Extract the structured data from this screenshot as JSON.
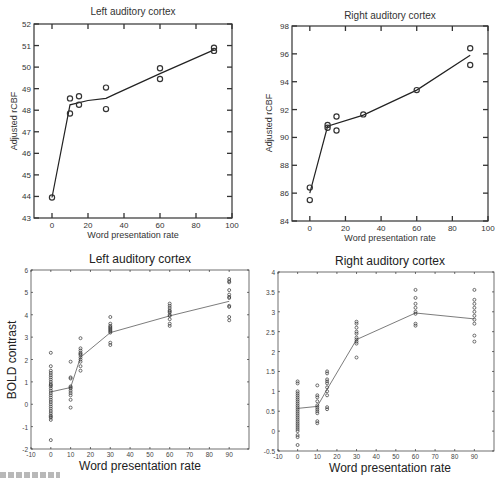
{
  "figure": {
    "panels": [
      "top-left",
      "top-right",
      "bottom-left",
      "bottom-right"
    ]
  },
  "chart_data": [
    {
      "id": "tl",
      "type": "scatter",
      "title": "Left auditory cortex",
      "xlabel": "Word presentation rate",
      "ylabel": "Adjusted rCBF",
      "xlim": [
        -10,
        100
      ],
      "ylim": [
        43,
        52
      ],
      "xticks": [
        0,
        20,
        40,
        60,
        80,
        100
      ],
      "yticks": [
        43,
        44,
        45,
        46,
        47,
        48,
        49,
        50,
        51,
        52
      ],
      "grid": false,
      "legend": null,
      "points": [
        [
          0,
          43.95
        ],
        [
          10,
          48.55
        ],
        [
          10,
          47.85
        ],
        [
          15,
          48.65
        ],
        [
          15,
          48.25
        ],
        [
          30,
          49.05
        ],
        [
          30,
          48.05
        ],
        [
          60,
          49.95
        ],
        [
          60,
          49.45
        ],
        [
          90,
          50.9
        ],
        [
          90,
          50.75
        ]
      ],
      "fit_line": [
        [
          0,
          43.95
        ],
        [
          10,
          48.25
        ],
        [
          20,
          48.45
        ],
        [
          30,
          48.55
        ],
        [
          35,
          48.75
        ],
        [
          60,
          49.7
        ],
        [
          90,
          50.8
        ]
      ]
    },
    {
      "id": "tr",
      "type": "scatter",
      "title": "Right auditory cortex",
      "xlabel": "Word presentation rate",
      "ylabel": "Adjusted rCBF",
      "xlim": [
        -10,
        100
      ],
      "ylim": [
        84,
        98
      ],
      "xticks": [
        0,
        20,
        40,
        60,
        80,
        100
      ],
      "yticks": [
        84,
        86,
        88,
        90,
        92,
        94,
        96,
        98
      ],
      "grid": false,
      "legend": null,
      "points": [
        [
          0,
          86.4
        ],
        [
          0,
          85.5
        ],
        [
          10,
          90.9
        ],
        [
          10,
          90.7
        ],
        [
          15,
          91.5
        ],
        [
          15,
          90.5
        ],
        [
          30,
          91.65
        ],
        [
          60,
          93.4
        ],
        [
          90,
          96.4
        ],
        [
          90,
          95.2
        ]
      ],
      "fit_line": [
        [
          0,
          86.0
        ],
        [
          10,
          90.8
        ],
        [
          30,
          91.6
        ],
        [
          60,
          93.4
        ],
        [
          90,
          95.9
        ]
      ]
    },
    {
      "id": "bl",
      "type": "scatter",
      "title": "Left auditory cortex",
      "xlabel": "Word presentation rate",
      "ylabel": "BOLD contrast",
      "xlim": [
        -10,
        100
      ],
      "ylim": [
        -2,
        6
      ],
      "xticks": [
        -10,
        0,
        10,
        20,
        30,
        40,
        50,
        60,
        70,
        80,
        90
      ],
      "yticks": [
        -2,
        -1,
        0,
        1,
        2,
        3,
        4,
        5,
        6
      ],
      "grid": false,
      "legend": null,
      "points": [
        [
          0,
          2.3
        ],
        [
          0,
          1.7
        ],
        [
          0,
          1.5
        ],
        [
          0,
          1.4
        ],
        [
          0,
          1.3
        ],
        [
          0,
          1.2
        ],
        [
          0,
          1.1
        ],
        [
          0,
          1.0
        ],
        [
          0,
          0.9
        ],
        [
          0,
          0.85
        ],
        [
          0,
          0.8
        ],
        [
          0,
          0.7
        ],
        [
          0,
          0.6
        ],
        [
          0,
          0.5
        ],
        [
          0,
          0.4
        ],
        [
          0,
          0.3
        ],
        [
          0,
          0.2
        ],
        [
          0,
          0.1
        ],
        [
          0,
          0.0
        ],
        [
          0,
          -0.1
        ],
        [
          0,
          -0.2
        ],
        [
          0,
          -0.3
        ],
        [
          0,
          -0.4
        ],
        [
          0,
          -0.5
        ],
        [
          0,
          -0.55
        ],
        [
          0,
          -0.6
        ],
        [
          0,
          -0.7
        ],
        [
          0,
          -1.6
        ],
        [
          10,
          1.9
        ],
        [
          10,
          1.2
        ],
        [
          10,
          1.15
        ],
        [
          10,
          0.8
        ],
        [
          10,
          0.75
        ],
        [
          10,
          0.7
        ],
        [
          10,
          0.6
        ],
        [
          10,
          0.5
        ],
        [
          10,
          0.4
        ],
        [
          10,
          0.2
        ],
        [
          10,
          -0.15
        ],
        [
          15,
          2.95
        ],
        [
          15,
          2.5
        ],
        [
          15,
          2.4
        ],
        [
          15,
          2.3
        ],
        [
          15,
          2.25
        ],
        [
          15,
          2.2
        ],
        [
          15,
          2.1
        ],
        [
          15,
          2.0
        ],
        [
          15,
          1.9
        ],
        [
          15,
          1.7
        ],
        [
          15,
          1.5
        ],
        [
          30,
          3.9
        ],
        [
          30,
          3.6
        ],
        [
          30,
          3.5
        ],
        [
          30,
          3.45
        ],
        [
          30,
          3.4
        ],
        [
          30,
          3.35
        ],
        [
          30,
          3.3
        ],
        [
          30,
          3.25
        ],
        [
          30,
          3.2
        ],
        [
          30,
          2.75
        ],
        [
          30,
          2.65
        ],
        [
          60,
          4.5
        ],
        [
          60,
          4.4
        ],
        [
          60,
          4.3
        ],
        [
          60,
          4.2
        ],
        [
          60,
          4.15
        ],
        [
          60,
          4.1
        ],
        [
          60,
          4.0
        ],
        [
          60,
          3.95
        ],
        [
          60,
          3.8
        ],
        [
          60,
          3.6
        ],
        [
          60,
          3.5
        ],
        [
          90,
          5.6
        ],
        [
          90,
          5.5
        ],
        [
          90,
          5.45
        ],
        [
          90,
          5.1
        ],
        [
          90,
          4.9
        ],
        [
          90,
          4.8
        ],
        [
          90,
          4.75
        ],
        [
          90,
          4.4
        ],
        [
          90,
          4.35
        ],
        [
          90,
          3.9
        ],
        [
          90,
          3.75
        ]
      ],
      "fit_line": [
        [
          0,
          0.55
        ],
        [
          10,
          0.75
        ],
        [
          15,
          2.1
        ],
        [
          30,
          3.2
        ],
        [
          60,
          3.95
        ],
        [
          90,
          4.6
        ]
      ]
    },
    {
      "id": "br",
      "type": "scatter",
      "title": "Right auditory cortex",
      "xlabel": "Word presentation rate",
      "ylabel": "",
      "xlim": [
        -10,
        100
      ],
      "ylim": [
        -0.5,
        4
      ],
      "xticks": [
        -10,
        0,
        10,
        20,
        30,
        40,
        50,
        60,
        70,
        80,
        90
      ],
      "yticks": [
        -0.5,
        0,
        0.5,
        1,
        1.5,
        2,
        2.5,
        3,
        3.5,
        4
      ],
      "ytick_labels": [
        "-0.5",
        "0",
        "0.5",
        "1",
        "1.5",
        "2",
        "2.5",
        "3",
        "3.5",
        "4"
      ],
      "grid": false,
      "legend": null,
      "points": [
        [
          0,
          1.25
        ],
        [
          0,
          1.2
        ],
        [
          0,
          1.0
        ],
        [
          0,
          0.95
        ],
        [
          0,
          0.9
        ],
        [
          0,
          0.85
        ],
        [
          0,
          0.8
        ],
        [
          0,
          0.75
        ],
        [
          0,
          0.7
        ],
        [
          0,
          0.65
        ],
        [
          0,
          0.6
        ],
        [
          0,
          0.55
        ],
        [
          0,
          0.5
        ],
        [
          0,
          0.45
        ],
        [
          0,
          0.4
        ],
        [
          0,
          0.35
        ],
        [
          0,
          0.3
        ],
        [
          0,
          0.25
        ],
        [
          0,
          0.2
        ],
        [
          0,
          0.15
        ],
        [
          0,
          0.1
        ],
        [
          0,
          0.05
        ],
        [
          0,
          0.0
        ],
        [
          0,
          -0.1
        ],
        [
          0,
          -0.15
        ],
        [
          0,
          -0.35
        ],
        [
          10,
          1.15
        ],
        [
          10,
          0.9
        ],
        [
          10,
          0.85
        ],
        [
          10,
          0.75
        ],
        [
          10,
          0.65
        ],
        [
          10,
          0.6
        ],
        [
          10,
          0.55
        ],
        [
          10,
          0.5
        ],
        [
          10,
          0.45
        ],
        [
          10,
          0.25
        ],
        [
          10,
          0.2
        ],
        [
          15,
          1.5
        ],
        [
          15,
          1.45
        ],
        [
          15,
          1.3
        ],
        [
          15,
          1.25
        ],
        [
          15,
          1.2
        ],
        [
          15,
          1.1
        ],
        [
          15,
          1.0
        ],
        [
          15,
          0.9
        ],
        [
          15,
          0.6
        ],
        [
          15,
          0.55
        ],
        [
          30,
          2.75
        ],
        [
          30,
          2.7
        ],
        [
          30,
          2.6
        ],
        [
          30,
          2.5
        ],
        [
          30,
          2.45
        ],
        [
          30,
          2.35
        ],
        [
          30,
          2.3
        ],
        [
          30,
          2.25
        ],
        [
          30,
          2.2
        ],
        [
          30,
          1.85
        ],
        [
          60,
          3.55
        ],
        [
          60,
          3.35
        ],
        [
          60,
          3.2
        ],
        [
          60,
          3.1
        ],
        [
          60,
          3.0
        ],
        [
          60,
          2.95
        ],
        [
          60,
          2.7
        ],
        [
          60,
          2.65
        ],
        [
          90,
          3.55
        ],
        [
          90,
          3.3
        ],
        [
          90,
          3.2
        ],
        [
          90,
          3.1
        ],
        [
          90,
          3.0
        ],
        [
          90,
          2.9
        ],
        [
          90,
          2.8
        ],
        [
          90,
          2.7
        ],
        [
          90,
          2.4
        ],
        [
          90,
          2.25
        ]
      ],
      "fit_line": [
        [
          0,
          0.57
        ],
        [
          10,
          0.62
        ],
        [
          15,
          1.05
        ],
        [
          30,
          2.3
        ],
        [
          60,
          2.97
        ],
        [
          90,
          2.82
        ]
      ]
    }
  ],
  "layout": {
    "tl": {
      "x0": 34,
      "x1": 232,
      "y0": 24,
      "y1": 218
    },
    "tr": {
      "x0": 292,
      "x1": 488,
      "y0": 26,
      "y1": 221
    },
    "bl": {
      "x0": 31,
      "x1": 249,
      "y0": 270,
      "y1": 449
    },
    "br": {
      "x0": 278,
      "x1": 494,
      "y0": 272,
      "y1": 451
    }
  }
}
